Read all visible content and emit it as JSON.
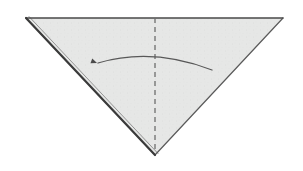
{
  "diagram": {
    "title": "Origami fold step",
    "caption": "Downward-pointing triangle with vertical dashed fold line and curved fold arrow pointing left",
    "canvas": {
      "width": 303,
      "height": 171
    },
    "background_color": "#ffffff"
  },
  "paper": {
    "name": "triangle-sheet",
    "shape": "triangle",
    "orientation": "point-down",
    "fill_color": "#e6e7e6",
    "texture_color": "#dcdddc",
    "vertices": [
      {
        "label": "top-left",
        "x": 26,
        "y": 18
      },
      {
        "label": "top-right",
        "x": 283,
        "y": 18
      },
      {
        "label": "bottom-apex",
        "x": 155,
        "y": 155
      }
    ],
    "edges": [
      {
        "name": "top-edge",
        "from": "top-left",
        "to": "top-right",
        "color": "#4a4a4a",
        "width": 1.4,
        "style": "solid"
      },
      {
        "name": "right-edge",
        "from": "top-right",
        "to": "bottom-apex",
        "color": "#5a5a5a",
        "width": 1.2,
        "style": "solid"
      },
      {
        "name": "left-edge",
        "from": "top-left",
        "to": "bottom-apex",
        "color": "#3a3a3a",
        "width": 2.2,
        "style": "solid"
      },
      {
        "name": "left-edge-underlayer",
        "from": "top-left",
        "to": "bottom-apex",
        "color": "#8a8a8a",
        "width": 0.9,
        "style": "solid",
        "offset_x": 3,
        "offset_y": -1.5
      }
    ]
  },
  "fold_line": {
    "name": "vertical-fold-crease",
    "style": "dashed",
    "color": "#6e6e6e",
    "width": 1.3,
    "dash_pattern": "5,4",
    "x": 155,
    "y_start": 18,
    "y_end": 152
  },
  "fold_arrow": {
    "name": "fold-direction-arrow",
    "direction": "right-to-left",
    "color": "#585858",
    "width": 1.3,
    "curve": {
      "start_x": 212,
      "start_y": 70,
      "control_x": 152,
      "control_y": 47,
      "end_x": 98,
      "end_y": 63
    },
    "arrowhead": {
      "name": "arrowhead",
      "x": 97,
      "y": 63,
      "size": 6,
      "angle_deg": 200,
      "color": "#4a4a4a"
    }
  }
}
